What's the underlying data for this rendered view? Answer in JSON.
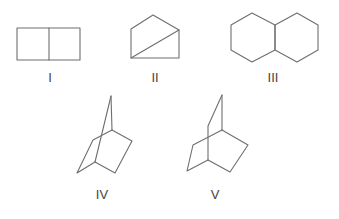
{
  "figure": {
    "structures": [
      {
        "id": "I",
        "label": "I",
        "name": "bicyclo[2.2.0]hexane (fused four-membered rings)"
      },
      {
        "id": "II",
        "label": "II",
        "name": "fused three- and five-membered ring system"
      },
      {
        "id": "III",
        "label": "III",
        "name": "decalin (fused six-membered rings)"
      },
      {
        "id": "IV",
        "label": "IV",
        "name": "norbornane (bridged bicyclo[2.2.1])"
      },
      {
        "id": "V",
        "label": "V",
        "name": "bicyclo[2.2.2]octane (bridged)"
      }
    ]
  },
  "colors": {
    "bond": "#6e6e6e",
    "label": "#444444",
    "background": "#ffffff"
  }
}
